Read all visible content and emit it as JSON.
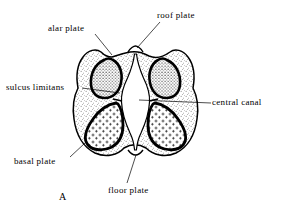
{
  "figure": {
    "letter": "A",
    "caption_letter_name": "figure-letter-a",
    "background_color": "#ffffff",
    "ink_color": "#000000",
    "labels": [
      {
        "id": "alar-plate",
        "text": "alar plate"
      },
      {
        "id": "roof-plate",
        "text": "roof plate"
      },
      {
        "id": "sulcus-limitans",
        "text": "sulcus limitans"
      },
      {
        "id": "central-canal",
        "text": "central canal"
      },
      {
        "id": "basal-plate",
        "text": "basal plate"
      },
      {
        "id": "floor-plate",
        "text": "floor plate"
      }
    ],
    "structures": [
      {
        "id": "alar-plate-left",
        "name": "left alar plate",
        "texture": "fine-dots"
      },
      {
        "id": "alar-plate-right",
        "name": "right alar plate",
        "texture": "fine-dots"
      },
      {
        "id": "basal-plate-left",
        "name": "left basal plate",
        "texture": "plus-marks"
      },
      {
        "id": "basal-plate-right",
        "name": "right basal plate",
        "texture": "plus-marks"
      },
      {
        "id": "central-canal",
        "name": "central canal",
        "texture": "blank-white"
      },
      {
        "id": "marginal-layer",
        "name": "marginal layer",
        "texture": "stipple"
      }
    ]
  }
}
